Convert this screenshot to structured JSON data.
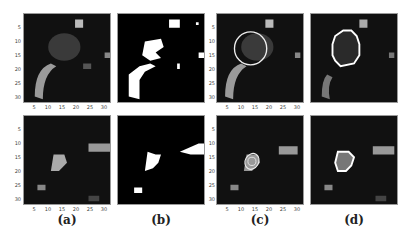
{
  "figure": {
    "captions": [
      "(a)",
      "(b)",
      "(c)",
      "(d)"
    ],
    "axes": {
      "x_ticks": [
        "5",
        "10",
        "15",
        "20",
        "25",
        "30"
      ],
      "y_ticks": [
        "5",
        "10",
        "15",
        "20",
        "25",
        "30"
      ]
    },
    "panels": [
      {
        "id": "a-top",
        "column": "(a)",
        "row": 1,
        "content": "grayscale image"
      },
      {
        "id": "b-top",
        "column": "(b)",
        "row": 1,
        "content": "binary mask"
      },
      {
        "id": "c-top",
        "column": "(c)",
        "row": 1,
        "content": "grayscale with circle contour"
      },
      {
        "id": "d-top",
        "column": "(d)",
        "row": 1,
        "content": "grayscale with segmented boundary"
      },
      {
        "id": "a-bottom",
        "column": "(a)",
        "row": 2,
        "content": "grayscale image"
      },
      {
        "id": "b-bottom",
        "column": "(b)",
        "row": 2,
        "content": "binary mask"
      },
      {
        "id": "c-bottom",
        "column": "(c)",
        "row": 2,
        "content": "grayscale with contours"
      },
      {
        "id": "d-bottom",
        "column": "(d)",
        "row": 2,
        "content": "grayscale with segmented boundary"
      }
    ]
  }
}
